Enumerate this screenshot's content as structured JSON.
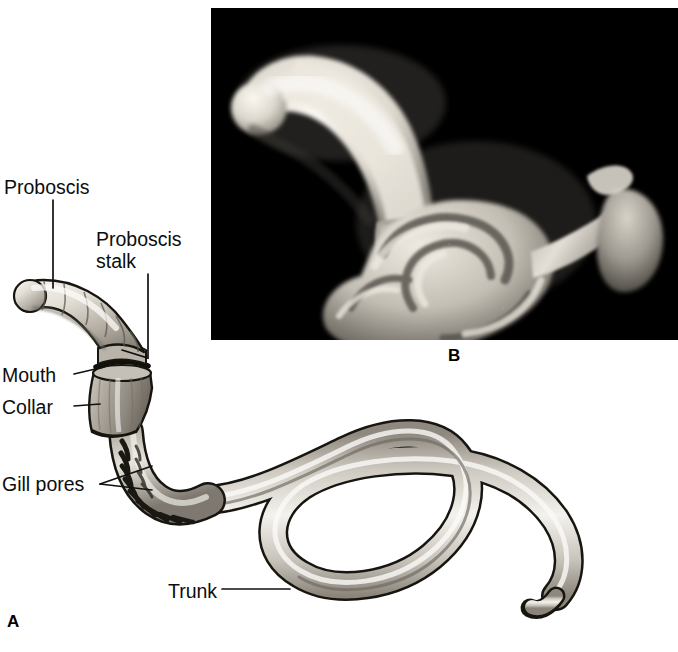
{
  "figure": {
    "panels": [
      {
        "letter": "A",
        "type": "line-drawing",
        "description": "Labeled ink drawing of a whole acorn worm showing proboscis, proboscis stalk, mouth, collar, gill pores and a long coiled trunk"
      },
      {
        "letter": "B",
        "type": "photograph",
        "background_color": "#000000",
        "description": "Photograph of a preserved acorn worm specimen on a black background, pale club-shaped proboscis at upper left and a coiled trunk mass at lower right"
      }
    ]
  },
  "panel_a": {
    "letter": "A",
    "labels": [
      {
        "id": "proboscis",
        "text": "Proboscis"
      },
      {
        "id": "proboscis_stalk",
        "line1": "Proboscis",
        "line2": "stalk",
        "text": "Proboscis\nstalk"
      },
      {
        "id": "mouth",
        "text": "Mouth"
      },
      {
        "id": "collar",
        "text": "Collar"
      },
      {
        "id": "gill_pores",
        "text": "Gill pores"
      },
      {
        "id": "trunk",
        "text": "Trunk"
      }
    ]
  },
  "panel_b": {
    "letter": "B"
  },
  "colors": {
    "background": "#ffffff",
    "photo_background": "#000000",
    "ink": "#0d0d0d",
    "leader_line": "#111111",
    "body_light": "#f2efe9",
    "body_mid": "#b9b3a9",
    "body_dark": "#6f6a62",
    "specimen_pale": "#efeae2",
    "specimen_mid": "#b6b1a8",
    "specimen_dark": "#6a665f"
  }
}
